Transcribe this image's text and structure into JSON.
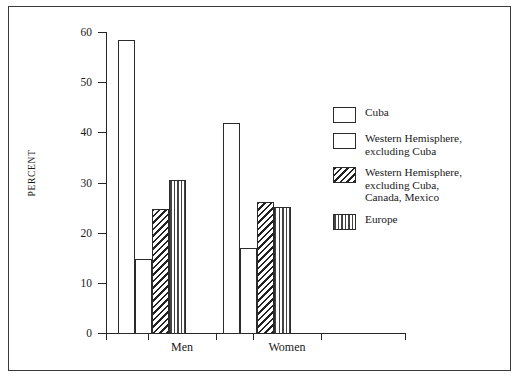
{
  "chart_data": {
    "type": "bar",
    "title": "",
    "subtitle": "",
    "xlabel": "",
    "ylabel": "PERCENT",
    "ylim": [
      0,
      60
    ],
    "yticks": [
      0,
      10,
      20,
      30,
      40,
      50,
      60
    ],
    "ytick_labels": [
      "0",
      "10",
      "20",
      "30",
      "40",
      "50",
      "60"
    ],
    "grid": false,
    "legend_position": "right",
    "categories": [
      "Men",
      "Women"
    ],
    "series": [
      {
        "name": "Cuba",
        "pattern": "plain",
        "values": [
          58.5,
          42.0
        ]
      },
      {
        "name": "Western Hemisphere,\nexcluding Cuba",
        "pattern": "dots",
        "values": [
          15.0,
          17.0
        ]
      },
      {
        "name": "Western Hemisphere,\nexcluding Cuba,\nCanada, Mexico",
        "pattern": "hatch",
        "values": [
          24.8,
          26.3
        ]
      },
      {
        "name": "Europe",
        "pattern": "vlines",
        "values": [
          30.5,
          25.2
        ]
      }
    ]
  },
  "axis": {
    "y_title": "PERCENT",
    "tick_0": "0",
    "tick_10": "10",
    "tick_20": "20",
    "tick_30": "30",
    "tick_40": "40",
    "tick_50": "50",
    "tick_60": "60"
  },
  "categories": {
    "men": "Men",
    "women": "Women"
  },
  "legend": {
    "items": [
      {
        "label": "Cuba"
      },
      {
        "label": "Western Hemisphere,\nexcluding Cuba"
      },
      {
        "label": "Western Hemisphere,\nexcluding Cuba,\nCanada, Mexico"
      },
      {
        "label": "Europe"
      }
    ]
  },
  "colors": {
    "ink": "#1a1a1a",
    "axis": "#262626",
    "frame": "#3a3a3a",
    "background": "#ffffff"
  }
}
